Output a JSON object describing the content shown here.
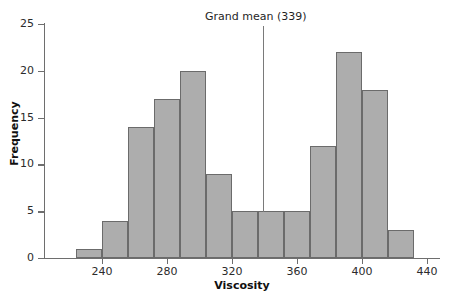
{
  "chart_data": {
    "type": "bar",
    "title": "",
    "subtitle": "",
    "xlabel": "Viscosity",
    "ylabel": "Frequency",
    "xlim": [
      216,
      440
    ],
    "ylim": [
      0,
      25
    ],
    "grid": false,
    "legend_position": "none",
    "bin_width": 16,
    "bin_starts": [
      224,
      240,
      256,
      272,
      288,
      304,
      320,
      336,
      352,
      368,
      384,
      400,
      416
    ],
    "bin_ends": [
      240,
      256,
      272,
      288,
      304,
      320,
      336,
      352,
      368,
      384,
      400,
      416,
      432
    ],
    "categories": [
      "224-240",
      "240-256",
      "256-272",
      "272-288",
      "288-304",
      "304-320",
      "320-336",
      "336-352",
      "352-368",
      "368-384",
      "384-400",
      "400-416",
      "416-432"
    ],
    "values": [
      1,
      4,
      14,
      17,
      20,
      9,
      5,
      5,
      5,
      12,
      22,
      18,
      3
    ],
    "x_ticks": [
      240,
      280,
      320,
      360,
      400,
      440
    ],
    "x_tick_labels": [
      "240",
      "280",
      "320",
      "360",
      "400",
      "440"
    ],
    "y_ticks": [
      0,
      5,
      10,
      15,
      20,
      25
    ],
    "y_tick_labels": [
      "0",
      "5",
      "10",
      "15",
      "20",
      "25"
    ],
    "annotations": [
      {
        "name": "grand-mean",
        "label": "Grand mean (339)",
        "value": 339,
        "type": "vline"
      }
    ],
    "colors": {
      "bar_fill": "#adadad",
      "bar_stroke": "#6b6b6b",
      "axis": "#6e6e6e",
      "mean_line": "#7a7a7a",
      "text": "#1a1a1a",
      "background": "#ffffff"
    }
  }
}
